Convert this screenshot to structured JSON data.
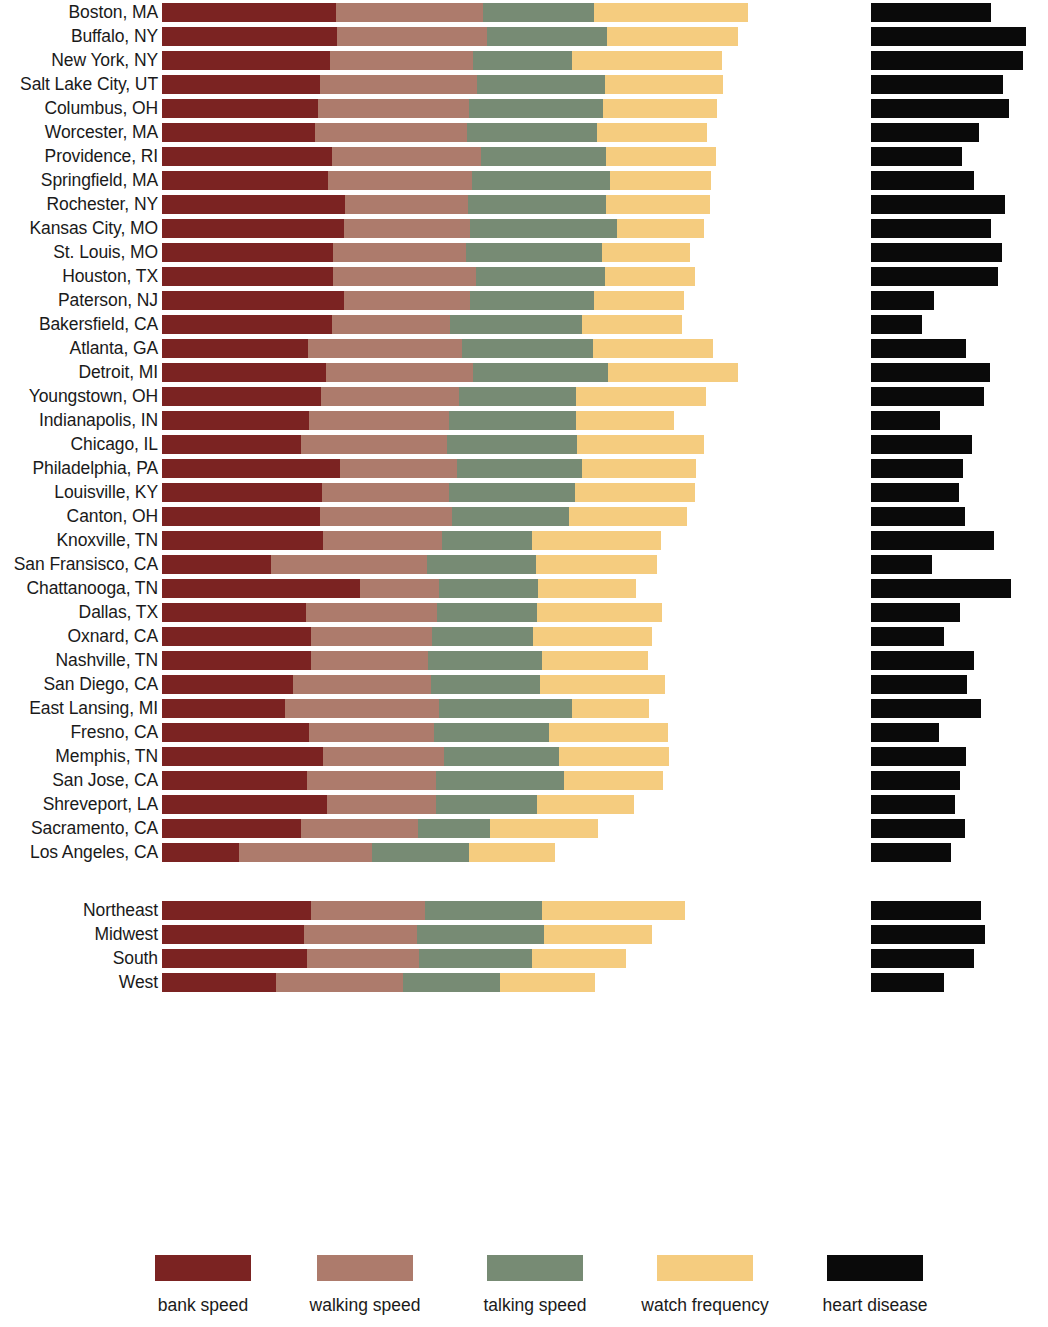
{
  "chart_data": {
    "type": "bar",
    "subtype": "stacked-horizontal-with-companion-bar",
    "title": "",
    "xlabel": "",
    "ylabel": "",
    "grid": false,
    "legend_position": "bottom",
    "legend": [
      "bank speed",
      "walking speed",
      "talking speed",
      "watch frequency",
      "heart disease"
    ],
    "series_names": [
      "bank speed",
      "walking speed",
      "talking speed",
      "watch frequency"
    ],
    "companion_series": "heart disease",
    "units": "relative pace index (arbitrary units, stacked); heart disease rate (separate scale)",
    "colors": {
      "bank_speed": "#7b2322",
      "walking_speed": "#ad7b6c",
      "talking_speed": "#778b74",
      "watch_frequency": "#f5cc7f",
      "heart_disease": "#0a0a0a",
      "background": "#ffffff",
      "text": "#1a1a1a"
    },
    "categories": [
      "Boston, MA",
      "Buffalo, NY",
      "New York, NY",
      "Salt Lake City, UT",
      "Columbus, OH",
      "Worcester, MA",
      "Providence, RI",
      "Springfield, MA",
      "Rochester, NY",
      "Kansas City, MO",
      "St. Louis, MO",
      "Houston, TX",
      "Paterson, NJ",
      "Bakersfield, CA",
      "Atlanta, GA",
      "Detroit, MI",
      "Youngstown, OH",
      "Indianapolis, IN",
      "Chicago, IL",
      "Philadelphia, PA",
      "Louisville, KY",
      "Canton, OH",
      "Knoxville, TN",
      "San Fransisco, CA",
      "Chattanooga, TN",
      "Dallas, TX",
      "Oxnard, CA",
      "Nashville, TN",
      "San Diego, CA",
      "East Lansing, MI",
      "Fresno, CA",
      "Memphis, TN",
      "San Jose, CA",
      "Shreveport, LA",
      "Sacramento, CA",
      "Los Angeles, CA"
    ],
    "region_categories": [
      "Northeast",
      "Midwest",
      "South",
      "West"
    ],
    "series": [
      {
        "name": "bank speed",
        "values": [
          176,
          177,
          170,
          160,
          158,
          155,
          172,
          168,
          185,
          184,
          173,
          173,
          184,
          172,
          147,
          166,
          161,
          148,
          140,
          180,
          162,
          160,
          163,
          110,
          200,
          145,
          150,
          150,
          132,
          124,
          148,
          163,
          146,
          167,
          140,
          78
        ],
        "region_values": [
          150,
          143,
          146,
          115
        ]
      },
      {
        "name": "walking speed",
        "values": [
          148,
          151,
          144,
          158,
          152,
          153,
          150,
          145,
          124,
          127,
          134,
          144,
          127,
          119,
          156,
          148,
          139,
          142,
          148,
          118,
          128,
          133,
          120,
          158,
          80,
          133,
          123,
          119,
          140,
          156,
          127,
          122,
          131,
          110,
          119,
          134
        ],
        "region_values": [
          116,
          115,
          114,
          128
        ]
      },
      {
        "name": "talking speed",
        "values": [
          112,
          122,
          100,
          130,
          135,
          131,
          126,
          140,
          140,
          149,
          137,
          130,
          125,
          133,
          132,
          137,
          118,
          128,
          131,
          126,
          127,
          118,
          91,
          110,
          100,
          101,
          102,
          115,
          110,
          134,
          116,
          116,
          129,
          102,
          72,
          98
        ],
        "region_values": [
          118,
          128,
          114,
          98
        ]
      },
      {
        "name": "watch frequency",
        "values": [
          156,
          132,
          152,
          119,
          116,
          112,
          112,
          102,
          105,
          88,
          89,
          91,
          91,
          101,
          122,
          131,
          132,
          99,
          128,
          115,
          121,
          119,
          130,
          122,
          99,
          126,
          120,
          107,
          126,
          78,
          120,
          111,
          100,
          98,
          109,
          87
        ],
        "region_values": [
          144,
          109,
          95,
          96
        ]
      },
      {
        "name": "heart disease",
        "values": [
          140,
          180,
          177,
          154,
          160,
          126,
          106,
          120,
          156,
          139,
          152,
          148,
          73,
          59,
          110,
          138,
          131,
          80,
          117,
          107,
          102,
          109,
          143,
          71,
          163,
          103,
          85,
          120,
          112,
          128,
          79,
          111,
          104,
          98,
          109,
          93
        ],
        "region_values": [
          128,
          132,
          120,
          85
        ]
      }
    ]
  },
  "legend": {
    "items": [
      {
        "label": "bank speed",
        "swatch": "bank",
        "color": "#7b2322"
      },
      {
        "label": "walking speed",
        "swatch": "walking",
        "color": "#ad7b6c"
      },
      {
        "label": "talking speed",
        "swatch": "talking",
        "color": "#778b74"
      },
      {
        "label": "watch frequency",
        "swatch": "watch",
        "color": "#f5cc7f"
      },
      {
        "label": "heart disease",
        "swatch": "heart",
        "color": "#0a0a0a"
      }
    ]
  }
}
